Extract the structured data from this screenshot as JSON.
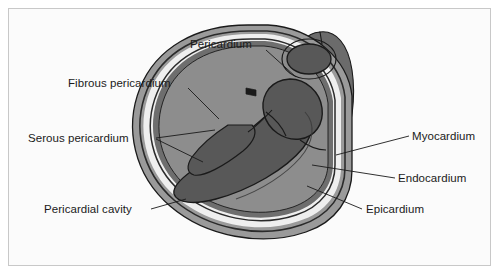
{
  "figure": {
    "frame": {
      "border_color": "#c8c8c8",
      "background_color": "#fbfbfb"
    },
    "palette": {
      "page_background": "#ffffff",
      "fibrous_pericardium": "#9a9a9a",
      "serous_pericardium_line": "#2b2b2b",
      "pericardial_cavity": "#efefef",
      "epicardium": "#6e6e6e",
      "myocardium": "#8d8d8d",
      "endocardium": "#3a3a3a",
      "chamber_cavity": "#585858",
      "great_vessel": "#6b6b6b",
      "outline": "#1a1a1a",
      "label_text": "#1a1a1a",
      "leader_line": "#1a1a1a"
    },
    "labels": [
      {
        "id": "pericardium",
        "text": "Pericardium",
        "text_x": 190,
        "text_y": 48,
        "anchor": "start",
        "leaders": [
          [
            [
              266,
              50
            ],
            [
              296,
              77
            ]
          ]
        ]
      },
      {
        "id": "fibrous-pericardium",
        "text": "Fibrous pericardium",
        "text_x": 68,
        "text_y": 87,
        "anchor": "start",
        "leaders": [
          [
            [
              188,
              88
            ],
            [
              219,
              119
            ]
          ]
        ]
      },
      {
        "id": "serous-pericardium",
        "text": "Serous pericardium",
        "text_x": 28,
        "text_y": 142,
        "anchor": "start",
        "leaders": [
          [
            [
              156,
              138
            ],
            [
              215,
              130
            ]
          ],
          [
            [
              156,
              139
            ],
            [
              203,
              162
            ]
          ]
        ]
      },
      {
        "id": "pericardial-cavity",
        "text": "Pericardial cavity",
        "text_x": 44,
        "text_y": 213,
        "anchor": "start",
        "leaders": [
          [
            [
              151,
              209
            ],
            [
              186,
              199
            ]
          ]
        ]
      },
      {
        "id": "myocardium",
        "text": "Myocardium",
        "text_x": 412,
        "text_y": 140,
        "anchor": "start",
        "leaders": [
          [
            [
              409,
              136
            ],
            [
              336,
              155
            ]
          ]
        ]
      },
      {
        "id": "endocardium",
        "text": "Endocardium",
        "text_x": 398,
        "text_y": 182,
        "anchor": "start",
        "leaders": [
          [
            [
              395,
              178
            ],
            [
              312,
              165
            ]
          ]
        ]
      },
      {
        "id": "epicardium",
        "text": "Epicardium",
        "text_x": 366,
        "text_y": 213,
        "anchor": "start",
        "leaders": [
          [
            [
              362,
              209
            ],
            [
              307,
              186
            ]
          ]
        ]
      }
    ]
  }
}
